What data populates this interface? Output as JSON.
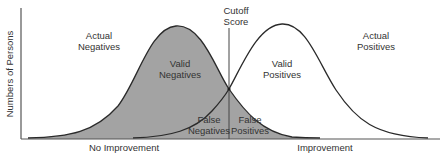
{
  "diagram": {
    "type": "overlapping-distributions",
    "y_axis_label": "Numbers of Persons",
    "x_axis": {
      "left_label": "No Improvement",
      "right_label": "Improvement"
    },
    "cutoff": {
      "label_line1": "Cutoff",
      "label_line2": "Score"
    },
    "regions": {
      "actual_negatives": {
        "line1": "Actual",
        "line2": "Negatives"
      },
      "actual_positives": {
        "line1": "Actual",
        "line2": "Positives"
      },
      "valid_negatives": {
        "line1": "Valid",
        "line2": "Negatives"
      },
      "valid_positives": {
        "line1": "Valid",
        "line2": "Positives"
      },
      "false_negatives": {
        "line1": "False",
        "line2": "Negatives"
      },
      "false_positives": {
        "line1": "False",
        "line2": "Positives"
      }
    },
    "colors": {
      "shaded_fill": "#a3a3a3",
      "line": "#2a2a2a",
      "axis": "#555555",
      "background": "#ffffff"
    }
  }
}
